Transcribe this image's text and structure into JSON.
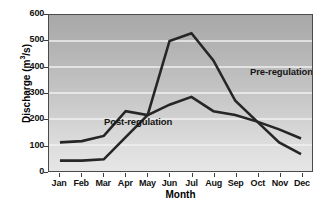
{
  "chart_data": {
    "type": "line",
    "title": "",
    "xlabel": "Month",
    "ylabel": "Discharge  (m3/s)",
    "ylabel_base": "Discharge  (m",
    "ylabel_sup": "3",
    "ylabel_tail": "/s)",
    "categories": [
      "Jan",
      "Feb",
      "Mar",
      "Apr",
      "May",
      "Jun",
      "Jul",
      "Aug",
      "Sep",
      "Oct",
      "Nov",
      "Dec"
    ],
    "ylim": [
      0,
      600
    ],
    "yticks": [
      0,
      100,
      200,
      300,
      400,
      500,
      600
    ],
    "ytick_labels": [
      "0",
      "100",
      "200",
      "300",
      "400",
      "500",
      "600"
    ],
    "grid": true,
    "grid_color": "#f0f0f0",
    "legend_position": "inline-annotation",
    "series": [
      {
        "name": "Post-regulation",
        "color": "#262626",
        "values": [
          110,
          115,
          135,
          230,
          215,
          255,
          285,
          230,
          215,
          190,
          160,
          125
        ]
      },
      {
        "name": "Pre-regulation",
        "color": "#262626",
        "values": [
          40,
          40,
          45,
          130,
          215,
          500,
          530,
          425,
          270,
          190,
          110,
          65
        ]
      }
    ],
    "annotations": [
      {
        "text": "Post-regulation",
        "series": "Post-regulation"
      },
      {
        "text": "Pre-regulation",
        "series": "Pre-regulation"
      }
    ]
  },
  "style": {
    "plot_border_color": "#4a4a4a",
    "line_color": "#262626",
    "text_color": "#111111",
    "background": "#ffffff"
  }
}
